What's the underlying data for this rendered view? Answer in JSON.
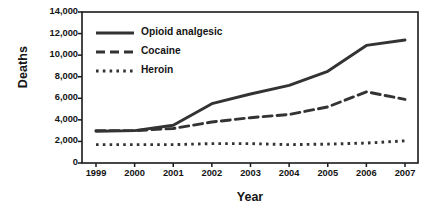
{
  "chart_data": {
    "type": "line",
    "title": "",
    "xlabel": "Year",
    "ylabel": "Deaths",
    "x": [
      1999,
      2000,
      2001,
      2002,
      2003,
      2004,
      2005,
      2006,
      2007
    ],
    "categories": [
      "1999",
      "2000",
      "2001",
      "2002",
      "2003",
      "2004",
      "2005",
      "2006",
      "2007"
    ],
    "xlim": [
      1999,
      2007
    ],
    "ylim": [
      0,
      14000
    ],
    "yticks": [
      0,
      2000,
      4000,
      6000,
      8000,
      10000,
      12000,
      14000
    ],
    "ytick_labels": [
      "0",
      "2,000",
      "4,000",
      "6,000",
      "8,000",
      "10,000",
      "12,000",
      "14,000"
    ],
    "xtick_labels": [
      "1999",
      "2000",
      "2001",
      "2002",
      "2003",
      "2004",
      "2005",
      "2006",
      "2007"
    ],
    "grid": false,
    "legend_position": "upper-left-inside",
    "series": [
      {
        "name": "Opioid analgesic",
        "style": "solid",
        "color": "#333333",
        "values": [
          2950,
          3000,
          3500,
          5500,
          6400,
          7200,
          8500,
          10900,
          11400
        ]
      },
      {
        "name": "Cocaine",
        "style": "dashed",
        "color": "#333333",
        "values": [
          3000,
          3000,
          3200,
          3800,
          4200,
          4500,
          5200,
          6600,
          5900
        ]
      },
      {
        "name": "Heroin",
        "style": "dotted",
        "color": "#333333",
        "values": [
          1700,
          1700,
          1700,
          1800,
          1800,
          1700,
          1750,
          1850,
          2050
        ]
      }
    ]
  },
  "axes": {
    "y_title": "Deaths",
    "x_title": "Year"
  },
  "legend": {
    "items": [
      {
        "label": "Opioid analgesic"
      },
      {
        "label": "Cocaine"
      },
      {
        "label": "Heroin"
      }
    ]
  }
}
